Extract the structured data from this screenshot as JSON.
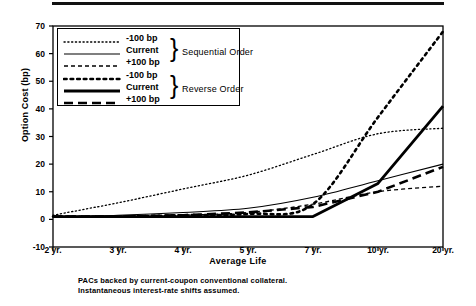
{
  "figure": {
    "top_rule": true,
    "footnote_line1": "PACs backed by current-coupon conventional collateral.",
    "footnote_line2": "Instantaneous interest-rate shifts assumed."
  },
  "legend": {
    "groups": [
      {
        "name": "Sequential Order",
        "entries": [
          {
            "label": "-100 bp",
            "style": "fine-dotted"
          },
          {
            "label": "Current",
            "style": "thin-solid"
          },
          {
            "label": "+100 bp",
            "style": "short-dashed"
          }
        ]
      },
      {
        "name": "Reverse Order",
        "entries": [
          {
            "label": "-100 bp",
            "style": "coarse-dotted"
          },
          {
            "label": "Current",
            "style": "thick-solid"
          },
          {
            "label": "+100 bp",
            "style": "long-dashed"
          }
        ]
      }
    ],
    "brace_glyph": "}"
  },
  "chart_data": {
    "type": "line",
    "title": "",
    "xlabel": "Average Life",
    "ylabel": "Option Cost (bp)",
    "categories": [
      "2 yr.",
      "3 yr.",
      "4 yr.",
      "5 yr.",
      "7 yr.",
      "10 yr.",
      "20 yr."
    ],
    "x_tick_labels": [
      "2 yr.",
      "3 yr.",
      "4 yr.",
      "5 yr.",
      "7 yr.",
      "10 yr.",
      "20 yr."
    ],
    "y_tick_labels": [
      "-10",
      "0",
      "10",
      "20",
      "30",
      "40",
      "50",
      "60",
      "70"
    ],
    "ylim": [
      -10,
      70
    ],
    "y_ticks": [
      -10,
      0,
      10,
      20,
      30,
      40,
      50,
      60,
      70
    ],
    "grid": false,
    "legend_position": "upper-left-inside",
    "series": [
      {
        "name": "-100 bp Sequential Order",
        "style": "fine-dotted",
        "values": [
          1.5,
          6.0,
          11.0,
          16.0,
          23.5,
          31.0,
          33.0
        ]
      },
      {
        "name": "Current Sequential Order",
        "style": "thin-solid",
        "values": [
          1.0,
          1.5,
          2.5,
          4.0,
          8.0,
          14.0,
          20.0
        ]
      },
      {
        "name": "+100 bp Sequential Order",
        "style": "short-dashed",
        "values": [
          1.0,
          1.0,
          1.5,
          2.5,
          5.5,
          10.0,
          12.0
        ]
      },
      {
        "name": "-100 bp Reverse Order",
        "style": "coarse-dotted",
        "values": [
          1.0,
          1.0,
          1.5,
          2.0,
          5.5,
          37.0,
          68.0
        ]
      },
      {
        "name": "Current Reverse Order",
        "style": "thick-solid",
        "values": [
          1.0,
          1.0,
          1.0,
          1.0,
          1.0,
          13.0,
          41.0
        ]
      },
      {
        "name": "+100 bp Reverse Order",
        "style": "long-dashed",
        "values": [
          1.0,
          1.0,
          1.5,
          2.5,
          4.5,
          10.0,
          19.0
        ]
      }
    ]
  }
}
